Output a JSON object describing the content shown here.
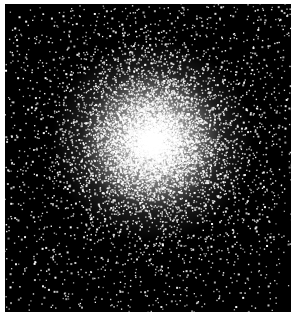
{
  "image": {
    "subject": "globular star cluster",
    "background_color": "#000000",
    "border_color": "#ffffff",
    "star_color": "#ffffff"
  },
  "cluster": {
    "center_x": 147,
    "center_y": 137,
    "core_radius": 42,
    "halo_star_count": 9000,
    "field_star_count": 900,
    "seed": 42
  }
}
